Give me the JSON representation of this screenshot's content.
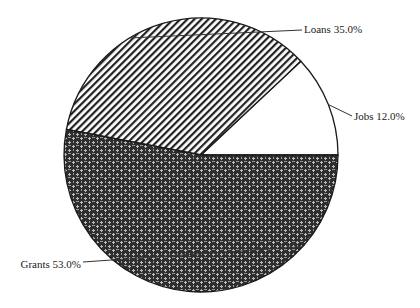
{
  "chart_data": {
    "type": "pie",
    "title": "",
    "title_visible": false,
    "start_angle_deg": 0,
    "direction": "counterclockwise",
    "slices": [
      {
        "label": "Jobs",
        "value": 12.0,
        "display": "Jobs 12.0%",
        "pattern": "none"
      },
      {
        "label": "Loans",
        "value": 35.0,
        "display": "Loans 35.0%",
        "pattern": "diagonal-hatch"
      },
      {
        "label": "Grants",
        "value": 53.0,
        "display": "Grants 53.0%",
        "pattern": "basket-weave"
      }
    ],
    "colors": {
      "outline": "#1a1a1a",
      "hatch": "#222222",
      "weave_dark": "#2e2e2e",
      "weave_light": "#bdbdbd",
      "background": "#ffffff"
    },
    "legend": "none",
    "labels": "outside-with-leader-lines"
  }
}
